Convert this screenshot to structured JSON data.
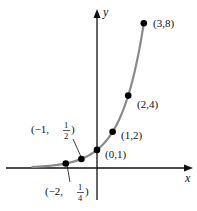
{
  "chart_data": {
    "type": "line",
    "title": "",
    "function": "y = 2^x",
    "xlabel": "x",
    "ylabel": "y",
    "x": [
      -2,
      -1,
      0,
      1,
      2,
      3
    ],
    "values": [
      0.25,
      0.5,
      1,
      2,
      4,
      8
    ],
    "point_labels": [
      {
        "x": -2,
        "y": 0.25,
        "text_prefix": "(−2, ",
        "num": "1",
        "den": "4",
        "text_suffix": ")"
      },
      {
        "x": -1,
        "y": 0.5,
        "text_prefix": "(−1, ",
        "num": "1",
        "den": "2",
        "text_suffix": ")"
      },
      {
        "x": 0,
        "y": 1,
        "text": "(0,1)"
      },
      {
        "x": 1,
        "y": 2,
        "text": "(1,2)"
      },
      {
        "x": 2,
        "y": 4,
        "text": "(2,4)"
      },
      {
        "x": 3,
        "y": 8,
        "text": "(3,8)"
      }
    ],
    "grid": false,
    "legend": "none",
    "curve_color": "#8a8a8a",
    "point_color": "#000000"
  }
}
